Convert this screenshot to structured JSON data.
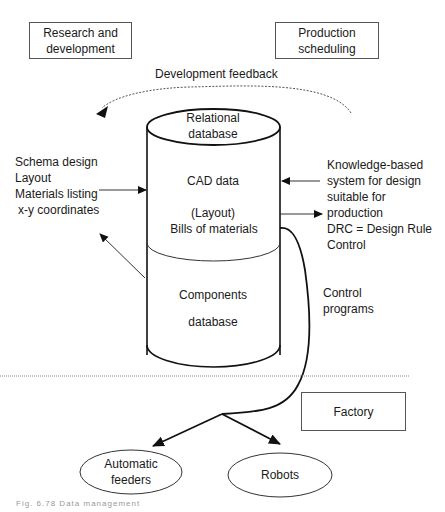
{
  "diagram": {
    "boxes": {
      "research": "Research and development",
      "research_l1": "Research and",
      "research_l2": "development",
      "production": "Production scheduling",
      "production_l1": "Production",
      "production_l2": "scheduling",
      "factory": "Factory"
    },
    "feedback_label": "Development feedback",
    "cylinder": {
      "top_l1": "Relational",
      "top_l2": "database",
      "mid_l1": "CAD  data",
      "mid_l2": "(Layout)",
      "mid_l3": "Bills of materials",
      "bottom_l1": "Components",
      "bottom_l2": "database"
    },
    "left_input": {
      "lines": [
        "Schema design",
        "Layout",
        "Materials listing",
        " x-y coordinates"
      ]
    },
    "right_system": {
      "lines": [
        "Knowledge-based",
        "system for design",
        "suitable for",
        "production",
        "DRC = Design Rule",
        "Control"
      ]
    },
    "control_programs": {
      "l1": "Control",
      "l2": "programs"
    },
    "ellipses": {
      "feeders_l1": "Automatic",
      "feeders_l2": "feeders",
      "robots": "Robots"
    },
    "caption": "Fig. 6.78  Data management"
  }
}
